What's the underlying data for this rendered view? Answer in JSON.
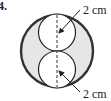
{
  "problem": {
    "number": "4."
  },
  "figure": {
    "outer_circle": {
      "cx": 57,
      "cy": 51,
      "r": 36,
      "fill": "#e6e6e6",
      "stroke": "#333333"
    },
    "inner_circles": [
      {
        "cx": 57,
        "cy": 32.5,
        "r": 18.5,
        "fill": "#ffffff",
        "stroke": "#222222"
      },
      {
        "cx": 57,
        "cy": 69.5,
        "r": 18.5,
        "fill": "#ffffff",
        "stroke": "#222222"
      }
    ],
    "diameter_line": {
      "x": 57,
      "y1": 15,
      "y2": 87,
      "dashed": true
    },
    "labels": [
      {
        "text": "2 cm",
        "x": 83,
        "y": 14
      },
      {
        "text": "2 cm",
        "x": 83,
        "y": 98
      }
    ],
    "arrows": [
      {
        "from": [
          80,
          10
        ],
        "to": [
          59,
          33
        ]
      },
      {
        "from": [
          80,
          92
        ],
        "to": [
          59,
          71
        ]
      }
    ]
  }
}
